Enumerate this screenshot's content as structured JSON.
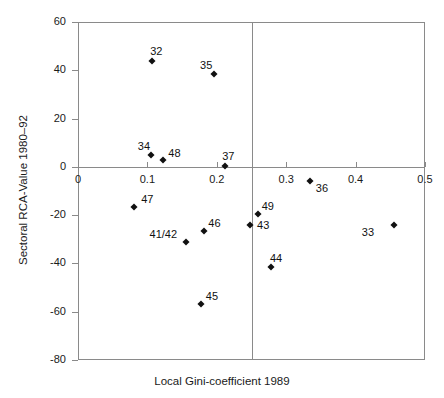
{
  "chart_data": {
    "type": "scatter",
    "title": "",
    "xlabel": "Local Gini-coefficient 1989",
    "ylabel": "Sectoral RCA-Value 1980–92",
    "xlim": [
      0,
      0.5
    ],
    "ylim": [
      -80,
      60
    ],
    "xticks": [
      "0",
      "0.1",
      "0.2",
      "0.3",
      "0.4",
      "0.5"
    ],
    "xtick_values": [
      0,
      0.1,
      0.2,
      0.3,
      0.4,
      0.5
    ],
    "yticks": [
      "60",
      "40",
      "20",
      "0",
      "-20",
      "-40",
      "-60",
      "-80"
    ],
    "ytick_values": [
      60,
      40,
      20,
      0,
      -20,
      -40,
      -60,
      -80
    ],
    "grid": false,
    "legend": "none",
    "reference_lines": [
      {
        "orientation": "vertical",
        "value": 0.25
      },
      {
        "orientation": "horizontal",
        "value": 0
      }
    ],
    "points": [
      {
        "label": "32",
        "x": 0.107,
        "y": 44,
        "label_dx": -2,
        "label_dy": -15
      },
      {
        "label": "35",
        "x": 0.196,
        "y": 38.5,
        "label_dx": -14,
        "label_dy": -14
      },
      {
        "label": "34",
        "x": 0.105,
        "y": 5,
        "label_dx": -13,
        "label_dy": -14
      },
      {
        "label": "48",
        "x": 0.123,
        "y": 3,
        "label_dx": 5,
        "label_dy": -12
      },
      {
        "label": "37",
        "x": 0.212,
        "y": 0.5,
        "label_dx": -3,
        "label_dy": -15
      },
      {
        "label": "36",
        "x": 0.334,
        "y": -6,
        "label_dx": 6,
        "label_dy": 2
      },
      {
        "label": "47",
        "x": 0.081,
        "y": -16.5,
        "label_dx": 7,
        "label_dy": -13
      },
      {
        "label": "49",
        "x": 0.259,
        "y": -19.5,
        "label_dx": 4,
        "label_dy": -13
      },
      {
        "label": "43",
        "x": 0.248,
        "y": -24,
        "label_dx": 7,
        "label_dy": -5
      },
      {
        "label": "46",
        "x": 0.182,
        "y": -26.5,
        "label_dx": 4,
        "label_dy": -13
      },
      {
        "label": "41/42",
        "x": 0.155,
        "y": -31,
        "label_dx": -36,
        "label_dy": -13
      },
      {
        "label": "33",
        "x": 0.455,
        "y": -24,
        "label_dx": -32,
        "label_dy": 2
      },
      {
        "label": "44",
        "x": 0.278,
        "y": -41.5,
        "label_dx": -1,
        "label_dy": -14
      },
      {
        "label": "45",
        "x": 0.177,
        "y": -57,
        "label_dx": 5,
        "label_dy": -13
      }
    ]
  },
  "colors": {
    "marker": "#111111",
    "axis": "#8a8a8a",
    "text": "#1a1a1a",
    "background": "#ffffff"
  }
}
